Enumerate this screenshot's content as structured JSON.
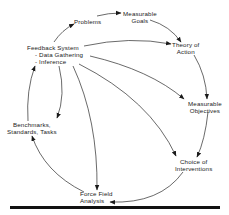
{
  "diagram": {
    "type": "cycle-flow",
    "nodes": {
      "problems": {
        "lines": [
          "Problems"
        ]
      },
      "goals": {
        "lines": [
          "Measurable",
          "Goals"
        ]
      },
      "theory": {
        "lines": [
          "Theory of",
          "Action"
        ]
      },
      "objectives": {
        "lines": [
          "Measurable",
          "Objectives"
        ]
      },
      "interventions": {
        "lines": [
          "Choice of",
          "Interventions"
        ]
      },
      "forcefield": {
        "lines": [
          "Force Field",
          "Analysis"
        ]
      },
      "benchmarks": {
        "lines": [
          "Benchmarks,",
          "Standards, Tasks"
        ]
      },
      "feedback": {
        "lines": [
          "Feedback System",
          "- Data Gathering",
          "- Inference"
        ]
      }
    },
    "edges": [
      {
        "from": "problems",
        "to": "goals"
      },
      {
        "from": "goals",
        "to": "theory"
      },
      {
        "from": "theory",
        "to": "objectives"
      },
      {
        "from": "objectives",
        "to": "interventions"
      },
      {
        "from": "interventions",
        "to": "forcefield"
      },
      {
        "from": "forcefield",
        "to": "benchmarks"
      },
      {
        "from": "benchmarks",
        "to": "feedback"
      },
      {
        "from": "feedback",
        "to": "problems"
      },
      {
        "from": "feedback",
        "to": "theory"
      },
      {
        "from": "feedback",
        "to": "objectives"
      },
      {
        "from": "feedback",
        "to": "interventions"
      },
      {
        "from": "feedback",
        "to": "forcefield"
      },
      {
        "from": "feedback",
        "to": "benchmarks"
      }
    ],
    "colors": {
      "ink": "#1a1a1a",
      "background": "#ffffff"
    }
  }
}
